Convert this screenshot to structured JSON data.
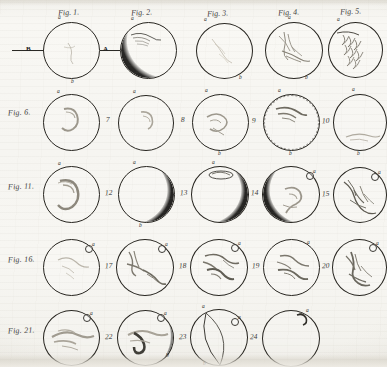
{
  "plate": {
    "title": "Engraved plate of telescopic disc observations",
    "medium": "copperplate engraving on laid paper",
    "paper_color": "#f6f5f1",
    "ink_color": "#26241f",
    "shade_color": "#151412",
    "rows": 5,
    "columns": 5,
    "figure_count": 24
  },
  "column_headers": [
    {
      "label": "Fig. 1."
    },
    {
      "label": "Fig. 2."
    },
    {
      "label": "Fig. 3."
    },
    {
      "label": "Fig. 4."
    },
    {
      "label": "Fig. 5."
    }
  ],
  "row_labels": [
    {
      "label": "Fig. 1."
    },
    {
      "label": "Fig. 6."
    },
    {
      "label": "Fig. 11."
    },
    {
      "label": "Fig. 16."
    },
    {
      "label": "Fig. 21."
    }
  ],
  "axis": {
    "left_letter": "B",
    "right_letter": "A"
  },
  "point_labels": {
    "top": "a",
    "bottom": "b"
  },
  "figures": [
    {
      "number": "1",
      "caption": "Fig. 1.",
      "shading": "none",
      "top_label": "a",
      "bottom_label": "b",
      "ring_marker": false,
      "dotted_limb": false,
      "arc": false
    },
    {
      "number": "2",
      "caption": "Fig. 2.",
      "shading": "crescent-left",
      "top_label": "a",
      "bottom_label": "",
      "ring_marker": false,
      "dotted_limb": false,
      "arc": false
    },
    {
      "number": "3",
      "caption": "Fig. 3.",
      "shading": "none",
      "top_label": "a",
      "bottom_label": "b",
      "ring_marker": false,
      "dotted_limb": false,
      "arc": false
    },
    {
      "number": "4",
      "caption": "Fig. 4.",
      "shading": "none",
      "top_label": "a",
      "bottom_label": "b",
      "ring_marker": false,
      "dotted_limb": false,
      "arc": false
    },
    {
      "number": "5",
      "caption": "Fig. 5.",
      "shading": "none",
      "top_label": "a",
      "bottom_label": "",
      "ring_marker": false,
      "dotted_limb": false,
      "arc": false
    },
    {
      "number": "6",
      "caption": "Fig. 6.",
      "shading": "none",
      "top_label": "a",
      "bottom_label": "",
      "ring_marker": false,
      "dotted_limb": false,
      "arc": false
    },
    {
      "number": "7",
      "caption": "7",
      "shading": "none",
      "top_label": "a",
      "bottom_label": "",
      "ring_marker": false,
      "dotted_limb": false,
      "arc": false
    },
    {
      "number": "8",
      "caption": "8",
      "shading": "none",
      "top_label": "a",
      "bottom_label": "b",
      "ring_marker": false,
      "dotted_limb": false,
      "arc": false
    },
    {
      "number": "9",
      "caption": "9",
      "shading": "none",
      "top_label": "a",
      "bottom_label": "b",
      "ring_marker": false,
      "dotted_limb": true,
      "arc": false
    },
    {
      "number": "10",
      "caption": "10",
      "shading": "none",
      "top_label": "a",
      "bottom_label": "b",
      "ring_marker": false,
      "dotted_limb": false,
      "arc": false
    },
    {
      "number": "11",
      "caption": "Fig. 11.",
      "shading": "none",
      "top_label": "a",
      "bottom_label": "",
      "ring_marker": false,
      "dotted_limb": false,
      "arc": false
    },
    {
      "number": "12",
      "caption": "12",
      "shading": "crescent-right",
      "top_label": "a",
      "bottom_label": "b",
      "ring_marker": false,
      "dotted_limb": false,
      "arc": false
    },
    {
      "number": "13",
      "caption": "13",
      "shading": "crescent-right",
      "top_label": "a",
      "bottom_label": "",
      "ring_marker": false,
      "dotted_limb": false,
      "arc": false
    },
    {
      "number": "14",
      "caption": "14",
      "shading": "crescent-left",
      "top_label": "a",
      "bottom_label": "",
      "ring_marker": true,
      "dotted_limb": false,
      "arc": false
    },
    {
      "number": "15",
      "caption": "15",
      "shading": "none",
      "top_label": "a",
      "bottom_label": "",
      "ring_marker": true,
      "dotted_limb": false,
      "arc": false
    },
    {
      "number": "16",
      "caption": "Fig. 16.",
      "shading": "none",
      "top_label": "a",
      "bottom_label": "",
      "ring_marker": true,
      "dotted_limb": false,
      "arc": false
    },
    {
      "number": "17",
      "caption": "17",
      "shading": "none",
      "top_label": "a",
      "bottom_label": "",
      "ring_marker": true,
      "dotted_limb": false,
      "arc": false
    },
    {
      "number": "18",
      "caption": "18",
      "shading": "none",
      "top_label": "a",
      "bottom_label": "",
      "ring_marker": true,
      "dotted_limb": false,
      "arc": false
    },
    {
      "number": "19",
      "caption": "19",
      "shading": "none",
      "top_label": "a",
      "bottom_label": "",
      "ring_marker": false,
      "dotted_limb": false,
      "arc": false
    },
    {
      "number": "20",
      "caption": "20",
      "shading": "none",
      "top_label": "a",
      "bottom_label": "",
      "ring_marker": true,
      "dotted_limb": false,
      "arc": false
    },
    {
      "number": "21",
      "caption": "Fig. 21.",
      "shading": "none",
      "top_label": "a",
      "bottom_label": "",
      "ring_marker": true,
      "dotted_limb": false,
      "arc": false
    },
    {
      "number": "22",
      "caption": "22",
      "shading": "crescent-thin-right",
      "top_label": "a",
      "bottom_label": "b",
      "ring_marker": true,
      "dotted_limb": false,
      "arc": false
    },
    {
      "number": "23",
      "caption": "23",
      "shading": "none",
      "top_label": "a",
      "bottom_label": "b",
      "ring_marker": true,
      "dotted_limb": false,
      "arc": true
    },
    {
      "number": "24",
      "caption": "24",
      "shading": "none",
      "top_label": "a",
      "bottom_label": "",
      "ring_marker": false,
      "dotted_limb": false,
      "arc": false
    }
  ]
}
